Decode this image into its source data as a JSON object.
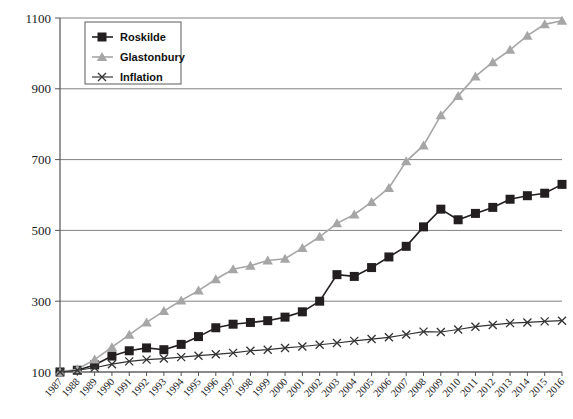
{
  "chart_data": {
    "type": "line",
    "title": "",
    "xlabel": "",
    "ylabel": "",
    "ylim": [
      100,
      1100
    ],
    "ytick_step": 200,
    "yticks": [
      100,
      300,
      500,
      700,
      900,
      1100
    ],
    "grid": true,
    "legend_position": "top-left-inside",
    "categories": [
      "1987",
      "1988",
      "1989",
      "1990",
      "1991",
      "1992",
      "1993",
      "1994",
      "1995",
      "1996",
      "1997",
      "1998",
      "1999",
      "2000",
      "2001",
      "2002",
      "2003",
      "2004",
      "2005",
      "2006",
      "2007",
      "2008",
      "2009",
      "2010",
      "2011",
      "2012",
      "2013",
      "2014",
      "2015",
      "2016"
    ],
    "series": [
      {
        "name": "Roskilde",
        "marker": "square",
        "color": "#231f20",
        "values": [
          100,
          105,
          120,
          145,
          160,
          168,
          163,
          178,
          200,
          225,
          235,
          240,
          245,
          255,
          270,
          300,
          375,
          370,
          395,
          425,
          455,
          510,
          560,
          530,
          548,
          565,
          588,
          598,
          605,
          630
        ]
      },
      {
        "name": "Glastonbury",
        "marker": "triangle",
        "color": "#a6a6a6",
        "values": [
          100,
          108,
          135,
          170,
          205,
          240,
          272,
          302,
          330,
          362,
          390,
          400,
          415,
          420,
          450,
          482,
          520,
          545,
          580,
          620,
          695,
          740,
          825,
          880,
          935,
          975,
          1010,
          1050,
          1082,
          1092
        ]
      },
      {
        "name": "Inflation",
        "marker": "x",
        "color": "#333333",
        "values": [
          100,
          105,
          112,
          122,
          130,
          135,
          138,
          142,
          146,
          150,
          154,
          160,
          163,
          168,
          172,
          177,
          182,
          188,
          193,
          198,
          206,
          214,
          213,
          220,
          228,
          233,
          238,
          240,
          243,
          245
        ]
      }
    ]
  },
  "legend": {
    "items": [
      {
        "label": "Roskilde"
      },
      {
        "label": "Glastonbury"
      },
      {
        "label": "Inflation"
      }
    ]
  },
  "axes": {
    "y_labels": [
      "1100",
      "900",
      "700",
      "500",
      "300",
      "100"
    ],
    "x_labels": [
      "1987",
      "1988",
      "1989",
      "1990",
      "1991",
      "1992",
      "1993",
      "1994",
      "1995",
      "1996",
      "1997",
      "1998",
      "1999",
      "2000",
      "2001",
      "2002",
      "2003",
      "2004",
      "2005",
      "2006",
      "2007",
      "2008",
      "2009",
      "2010",
      "2011",
      "2012",
      "2013",
      "2014",
      "2015",
      "2016"
    ]
  }
}
